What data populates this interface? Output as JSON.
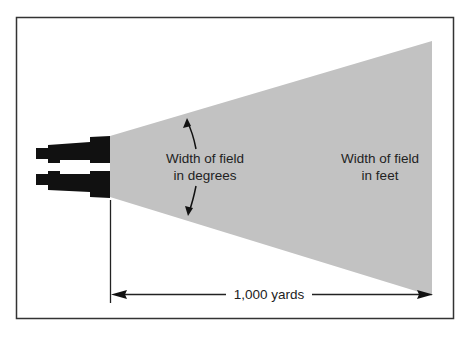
{
  "diagram": {
    "labels": {
      "angle_line1": "Width of field",
      "angle_line2": "in degrees",
      "feet_line1": "Width of field",
      "feet_line2": "in feet",
      "distance": "1,000 yards"
    },
    "colors": {
      "cone": "#c2c2c2",
      "binoculars": "#111111",
      "frame": "#333333",
      "text": "#222222"
    }
  }
}
